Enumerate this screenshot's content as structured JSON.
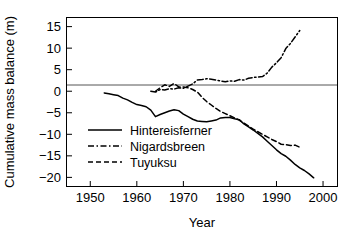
{
  "chart_data": {
    "type": "line",
    "title": "",
    "xlabel": "Year",
    "ylabel": "Cumulative mass balance (m)",
    "xlim": [
      1945,
      2003
    ],
    "ylim": [
      -22,
      17
    ],
    "xticks": [
      1950,
      1960,
      1970,
      1980,
      1990,
      2000
    ],
    "xtick_labels": [
      "1950",
      "1960",
      "1970",
      "1980",
      "1990",
      "2000"
    ],
    "yticks": [
      15,
      10,
      5,
      0,
      -5,
      -10,
      -15,
      -20
    ],
    "ytick_labels": [
      "15",
      "10",
      "5",
      "0",
      "−5",
      "−10",
      "−15",
      "−20"
    ],
    "grid": false,
    "zero_line": true,
    "legend_position": "lower-left-inside",
    "series": [
      {
        "name": "Hintereisferner",
        "style": "solid",
        "color": "#000000",
        "x": [
          1953,
          1954,
          1955,
          1956,
          1957,
          1958,
          1959,
          1960,
          1961,
          1962,
          1963,
          1964,
          1965,
          1966,
          1967,
          1968,
          1969,
          1970,
          1971,
          1972,
          1973,
          1974,
          1975,
          1976,
          1977,
          1978,
          1979,
          1980,
          1981,
          1982,
          1983,
          1984,
          1985,
          1986,
          1987,
          1988,
          1989,
          1990,
          1991,
          1992,
          1993,
          1994,
          1995,
          1996,
          1997,
          1998
        ],
        "y": [
          -0.4,
          -0.6,
          -0.8,
          -1.0,
          -1.6,
          -2.0,
          -2.6,
          -3.1,
          -3.3,
          -3.6,
          -4.4,
          -5.9,
          -5.4,
          -5.0,
          -4.6,
          -4.3,
          -4.5,
          -5.3,
          -5.9,
          -6.5,
          -6.9,
          -7.0,
          -7.1,
          -6.9,
          -6.7,
          -6.2,
          -6.1,
          -6.1,
          -6.4,
          -6.6,
          -7.6,
          -8.3,
          -9.0,
          -9.8,
          -10.6,
          -11.6,
          -12.6,
          -13.6,
          -14.5,
          -15.1,
          -16.0,
          -17.0,
          -17.8,
          -18.4,
          -19.2,
          -20.1
        ]
      },
      {
        "name": "Nigardsbreen",
        "style": "dashdot",
        "color": "#000000",
        "x": [
          1963,
          1964,
          1965,
          1966,
          1967,
          1968,
          1969,
          1970,
          1971,
          1972,
          1973,
          1974,
          1975,
          1976,
          1977,
          1978,
          1979,
          1980,
          1981,
          1982,
          1983,
          1984,
          1985,
          1986,
          1987,
          1988,
          1989,
          1990,
          1991,
          1992,
          1993,
          1994,
          1995
        ],
        "y": [
          0.0,
          -0.2,
          0.4,
          0.3,
          0.6,
          0.5,
          0.8,
          0.7,
          1.2,
          1.7,
          2.6,
          2.7,
          2.9,
          2.8,
          2.6,
          2.4,
          2.2,
          2.4,
          2.3,
          2.7,
          2.6,
          3.0,
          3.2,
          3.3,
          3.4,
          4.2,
          5.6,
          6.6,
          7.8,
          9.9,
          11.1,
          12.6,
          14.1
        ]
      },
      {
        "name": "Tuyuksu",
        "style": "dashed",
        "color": "#000000",
        "x": [
          1964,
          1965,
          1966,
          1967,
          1968,
          1969,
          1970,
          1971,
          1972,
          1973,
          1974,
          1975,
          1976,
          1977,
          1978,
          1979,
          1980,
          1981,
          1982,
          1983,
          1984,
          1985,
          1986,
          1987,
          1988,
          1989,
          1990,
          1991,
          1992,
          1993,
          1994,
          1995
        ],
        "y": [
          0.0,
          0.8,
          1.5,
          1.1,
          1.8,
          1.0,
          1.0,
          0.8,
          0.4,
          -0.2,
          -1.4,
          -2.4,
          -3.2,
          -4.0,
          -4.7,
          -5.2,
          -5.7,
          -6.2,
          -6.7,
          -7.4,
          -8.1,
          -8.8,
          -9.4,
          -10.0,
          -10.6,
          -11.2,
          -11.7,
          -12.3,
          -12.4,
          -12.6,
          -12.5,
          -13.0
        ]
      }
    ]
  },
  "legend": {
    "items": [
      {
        "label": "Hintereisferner",
        "style": "solid"
      },
      {
        "label": "Nigardsbreen",
        "style": "dashdot"
      },
      {
        "label": "Tuyuksu",
        "style": "dashed"
      }
    ]
  }
}
